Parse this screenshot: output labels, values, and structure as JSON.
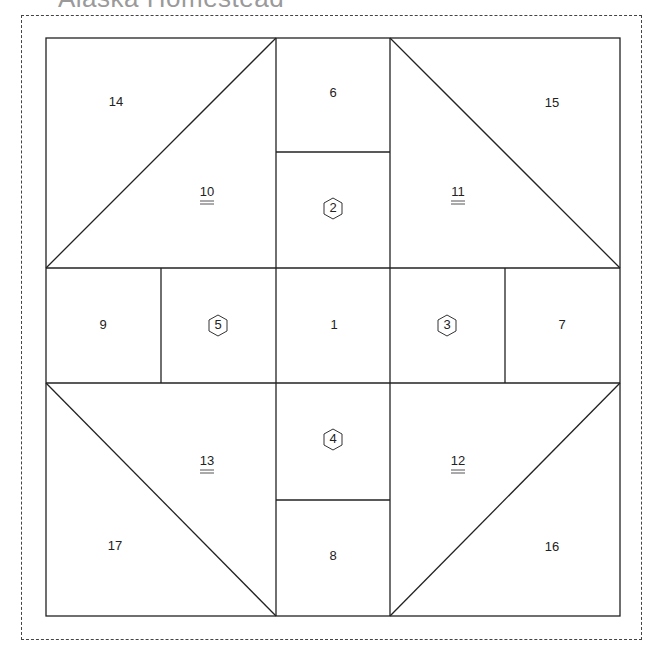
{
  "title": "Alaska Homestead",
  "colors": {
    "line": "#222222",
    "dashed_border": "#444444",
    "title": "#9a9a9a"
  },
  "block": {
    "outer": {
      "x1": 46,
      "y1": 38,
      "x2": 620,
      "y2": 616
    },
    "columns_x": [
      46,
      161,
      276,
      390,
      505,
      620
    ],
    "rows_y": [
      38,
      152,
      268,
      383,
      500,
      616
    ]
  },
  "pieces": {
    "p1": {
      "label": "1",
      "style": "plain"
    },
    "p2": {
      "label": "2",
      "style": "hexagon"
    },
    "p3": {
      "label": "3",
      "style": "hexagon"
    },
    "p4": {
      "label": "4",
      "style": "hexagon"
    },
    "p5": {
      "label": "5",
      "style": "hexagon"
    },
    "p6": {
      "label": "6",
      "style": "plain"
    },
    "p7": {
      "label": "7",
      "style": "plain"
    },
    "p8": {
      "label": "8",
      "style": "plain"
    },
    "p9": {
      "label": "9",
      "style": "plain"
    },
    "p10": {
      "label": "10",
      "style": "double-underline"
    },
    "p11": {
      "label": "11",
      "style": "double-underline"
    },
    "p12": {
      "label": "12",
      "style": "double-underline"
    },
    "p13": {
      "label": "13",
      "style": "double-underline"
    },
    "p14": {
      "label": "14",
      "style": "plain"
    },
    "p15": {
      "label": "15",
      "style": "plain"
    },
    "p16": {
      "label": "16",
      "style": "plain"
    },
    "p17": {
      "label": "17",
      "style": "plain"
    }
  }
}
